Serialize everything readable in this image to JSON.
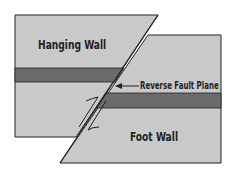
{
  "diagram": {
    "labels": {
      "hanging_wall": "Hanging Wall",
      "foot_wall": "Foot Wall",
      "fault_plane": "Reverse Fault Plane"
    },
    "colors": {
      "rock": "#c9c9c9",
      "layer": "#6b6b6b",
      "outline": "#222222"
    }
  }
}
